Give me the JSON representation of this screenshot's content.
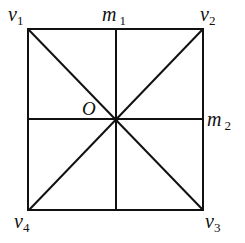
{
  "diagram": {
    "vertices": [
      {
        "name": "v",
        "sub": "1",
        "x": 28,
        "y": 29
      },
      {
        "name": "v",
        "sub": "2",
        "x": 203,
        "y": 29
      },
      {
        "name": "v",
        "sub": "3",
        "x": 203,
        "y": 210
      },
      {
        "name": "v",
        "sub": "4",
        "x": 29,
        "y": 210
      }
    ],
    "midpoints": [
      {
        "name": "m",
        "sub": "1",
        "x": 116,
        "y": 29
      },
      {
        "name": "m",
        "sub": "2",
        "x": 203,
        "y": 119
      }
    ],
    "center": {
      "name": "O",
      "x": 116,
      "y": 119
    },
    "labels": {
      "v1": {
        "main": "v",
        "sub": "1"
      },
      "v2": {
        "main": "v",
        "sub": "2"
      },
      "v3": {
        "main": "v",
        "sub": "3"
      },
      "v4": {
        "main": "v",
        "sub": "4"
      },
      "m1": {
        "main": "m",
        "sub": "1"
      },
      "m2": {
        "main": "m",
        "sub": "2"
      },
      "O": "O"
    },
    "line_color": "#111111"
  }
}
